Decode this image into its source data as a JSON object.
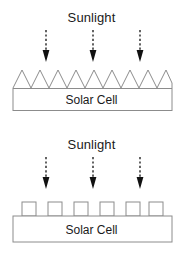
{
  "figure": {
    "width": 183,
    "height": 253,
    "background": "#ffffff",
    "line_color": "#8c8c8c",
    "arrow_color": "#111111",
    "text_color": "#1a1a1a"
  },
  "panels": [
    {
      "id": "textured-pyramid-cell",
      "sunlight_label": "Sunlight",
      "cell_label": "Solar Cell",
      "surface_type": "sawtooth-pyramid",
      "surface_feature_count": 8,
      "arrow_count": 3,
      "arrow_x_positions": [
        46,
        93,
        140
      ]
    },
    {
      "id": "textured-square-cell",
      "sunlight_label": "Sunlight",
      "cell_label": "Solar Cell",
      "surface_type": "square-pillar",
      "surface_feature_count": 6,
      "arrow_count": 3,
      "arrow_x_positions": [
        46,
        93,
        140
      ]
    }
  ],
  "icons": {
    "arrow": "dashed-down-arrow-icon"
  }
}
